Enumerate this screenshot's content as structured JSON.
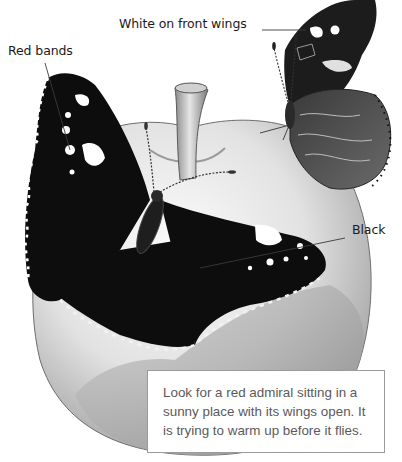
{
  "figure": {
    "style": "grayscale pencil illustration"
  },
  "labels": {
    "red_bands": "Red bands",
    "white_on_front_wings": "White on front wings",
    "black": "Black"
  },
  "caption": {
    "text": "Look for a red admiral sitting in a sunny place with its wings open. It is trying to warm up before it flies."
  },
  "colors": {
    "background": "#ffffff",
    "label_text": "#1a1a1a",
    "caption_text": "#5a5a5a",
    "caption_border": "#9a9a9a",
    "wing_black": "#0d0d0d",
    "apple_light": "#ececec",
    "apple_shade": "#a8a8a8"
  }
}
